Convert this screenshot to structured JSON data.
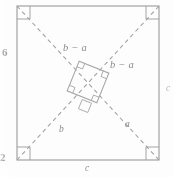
{
  "figure": {
    "caption_side_label": "6",
    "caption_corner_label": "2",
    "right_edge_label": "c",
    "stroke_color": "#9a9a9a",
    "dash_color": "#a0a0a0",
    "label_color": "#8a8a8a",
    "background": "#fdfdfd"
  },
  "labels": {
    "side_bottom": "c",
    "side_right": "c",
    "diagonal_lower_left": "b",
    "diagonal_lower_right": "a",
    "inner_upper_left": "b − a",
    "inner_right": "b − a"
  },
  "margin_marks": {
    "left_page_number": "6",
    "bottom_left_number": "2"
  },
  "geometry": {
    "outer_square": {
      "left": 17,
      "top": 6,
      "right": 159,
      "bottom": 160,
      "corner_marks": 4
    },
    "diagonals": [
      {
        "name": "top-left-to-bottom-right",
        "x1": 17,
        "y1": 6,
        "x2": 159,
        "y2": 160
      },
      {
        "name": "bottom-left-to-top-right",
        "x1": 17,
        "y1": 160,
        "x2": 159,
        "y2": 6
      }
    ],
    "inner_square": {
      "center_x": 88,
      "center_y": 82,
      "half_diagonal": 22,
      "rotation_deg": 20,
      "right_angle_marks": 4
    }
  }
}
